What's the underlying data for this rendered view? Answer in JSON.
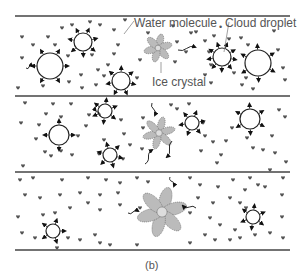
{
  "labels": {
    "water_molecule": "Water molecule",
    "cloud_droplet": "Cloud droplet",
    "ice_crystal": "Ice crystal",
    "caption": "(b)"
  },
  "colors": {
    "line": "#444444",
    "droplet_stroke": "#222222",
    "molecule": "#555555",
    "crystal_fill": "#bbbbbb",
    "crystal_stroke": "#777777",
    "label_text": "#555555"
  },
  "separators": [
    {
      "y": 16,
      "x1": 15,
      "x2": 290
    },
    {
      "y": 96,
      "x1": 15,
      "x2": 290
    },
    {
      "y": 172,
      "x1": 15,
      "x2": 290
    },
    {
      "y": 250,
      "x1": 15,
      "x2": 290
    }
  ],
  "panels": [
    {
      "name": "panel-1",
      "crystal": {
        "cx": 158,
        "cy": 48,
        "r": 13,
        "petal_w": 3.5
      },
      "droplets": [
        {
          "cx": 50,
          "cy": 66,
          "r": 13,
          "arrows": 6
        },
        {
          "cx": 83,
          "cy": 42,
          "r": 9,
          "arrows": 7
        },
        {
          "cx": 121,
          "cy": 81,
          "r": 9,
          "arrows": 7
        },
        {
          "cx": 222,
          "cy": 57,
          "r": 9,
          "arrows": 9
        },
        {
          "cx": 258,
          "cy": 63,
          "r": 13,
          "arrows": 6
        }
      ],
      "molecules": [
        [
          22,
          37
        ],
        [
          33,
          45
        ],
        [
          22,
          58
        ],
        [
          18,
          88
        ],
        [
          43,
          86
        ],
        [
          48,
          37
        ],
        [
          55,
          45
        ],
        [
          62,
          28
        ],
        [
          72,
          25
        ],
        [
          90,
          22
        ],
        [
          100,
          25
        ],
        [
          114,
          30
        ],
        [
          125,
          20
        ],
        [
          118,
          45
        ],
        [
          114,
          54
        ],
        [
          108,
          65
        ],
        [
          98,
          70
        ],
        [
          69,
          82
        ],
        [
          81,
          75
        ],
        [
          82,
          88
        ],
        [
          96,
          85
        ],
        [
          92,
          55
        ],
        [
          68,
          56
        ],
        [
          104,
          76
        ],
        [
          140,
          60
        ],
        [
          137,
          78
        ],
        [
          148,
          33
        ],
        [
          177,
          42
        ],
        [
          186,
          52
        ],
        [
          175,
          62
        ],
        [
          196,
          32
        ],
        [
          205,
          41
        ],
        [
          214,
          36
        ],
        [
          209,
          52
        ],
        [
          211,
          65
        ],
        [
          205,
          75
        ],
        [
          211,
          83
        ],
        [
          229,
          39
        ],
        [
          241,
          38
        ],
        [
          248,
          45
        ],
        [
          234,
          73
        ],
        [
          246,
          78
        ],
        [
          242,
          85
        ],
        [
          253,
          89
        ],
        [
          274,
          31
        ],
        [
          278,
          50
        ],
        [
          283,
          68
        ],
        [
          285,
          80
        ],
        [
          191,
          33
        ],
        [
          173,
          26
        ]
      ]
    },
    {
      "name": "panel-2",
      "crystal": {
        "cx": 159,
        "cy": 133,
        "r": 15,
        "petal_w": 3.5
      },
      "droplets": [
        {
          "cx": 59,
          "cy": 135,
          "r": 10,
          "arrows": 4
        },
        {
          "cx": 105,
          "cy": 111,
          "r": 7,
          "arrows": 6
        },
        {
          "cx": 110,
          "cy": 155,
          "r": 7,
          "arrows": 6
        },
        {
          "cx": 192,
          "cy": 123,
          "r": 7,
          "arrows": 6
        },
        {
          "cx": 250,
          "cy": 119,
          "r": 10,
          "arrows": 6
        }
      ],
      "molecules": [
        [
          25,
          103
        ],
        [
          53,
          104
        ],
        [
          71,
          104
        ],
        [
          46,
          114
        ],
        [
          61,
          117
        ],
        [
          21,
          123
        ],
        [
          39,
          125
        ],
        [
          36,
          139
        ],
        [
          45,
          152
        ],
        [
          23,
          166
        ],
        [
          51,
          156
        ],
        [
          61,
          151
        ],
        [
          72,
          155
        ],
        [
          78,
          136
        ],
        [
          86,
          126
        ],
        [
          89,
          115
        ],
        [
          104,
          140
        ],
        [
          99,
          154
        ],
        [
          121,
          120
        ],
        [
          124,
          134
        ],
        [
          130,
          145
        ],
        [
          123,
          159
        ],
        [
          143,
          118
        ],
        [
          143,
          128
        ],
        [
          142,
          149
        ],
        [
          171,
          105
        ],
        [
          177,
          109
        ],
        [
          189,
          104
        ],
        [
          203,
          123
        ],
        [
          201,
          151
        ],
        [
          205,
          136
        ],
        [
          213,
          142
        ],
        [
          221,
          155
        ],
        [
          217,
          163
        ],
        [
          226,
          141
        ],
        [
          232,
          128
        ],
        [
          247,
          138
        ],
        [
          253,
          148
        ],
        [
          263,
          150
        ],
        [
          272,
          136
        ],
        [
          275,
          153
        ],
        [
          285,
          117
        ],
        [
          279,
          110
        ],
        [
          286,
          162
        ],
        [
          270,
          170
        ]
      ]
    },
    {
      "name": "panel-3",
      "crystal": {
        "cx": 162,
        "cy": 212,
        "r": 23,
        "petal_w": 6
      },
      "droplets": [
        {
          "cx": 53,
          "cy": 231,
          "r": 7,
          "arrows": 5
        },
        {
          "cx": 253,
          "cy": 217,
          "r": 7,
          "arrows": 6
        }
      ],
      "molecules": [
        [
          20,
          180
        ],
        [
          33,
          178
        ],
        [
          62,
          180
        ],
        [
          88,
          178
        ],
        [
          106,
          180
        ],
        [
          120,
          183
        ],
        [
          137,
          178
        ],
        [
          148,
          182
        ],
        [
          190,
          178
        ],
        [
          200,
          185
        ],
        [
          218,
          187
        ],
        [
          233,
          180
        ],
        [
          250,
          178
        ],
        [
          258,
          185
        ],
        [
          283,
          178
        ],
        [
          25,
          195
        ],
        [
          40,
          198
        ],
        [
          60,
          195
        ],
        [
          80,
          193
        ],
        [
          100,
          195
        ],
        [
          118,
          193
        ],
        [
          140,
          208
        ],
        [
          190,
          213
        ],
        [
          198,
          198
        ],
        [
          213,
          203
        ],
        [
          230,
          198
        ],
        [
          240,
          203
        ],
        [
          246,
          208
        ],
        [
          245,
          190
        ],
        [
          265,
          187
        ],
        [
          282,
          195
        ],
        [
          18,
          217
        ],
        [
          43,
          215
        ],
        [
          55,
          213
        ],
        [
          70,
          208
        ],
        [
          88,
          203
        ],
        [
          100,
          210
        ],
        [
          120,
          205
        ],
        [
          210,
          218
        ],
        [
          220,
          225
        ],
        [
          235,
          230
        ],
        [
          240,
          238
        ],
        [
          255,
          235
        ],
        [
          270,
          233
        ],
        [
          282,
          217
        ],
        [
          283,
          238
        ],
        [
          22,
          233
        ],
        [
          35,
          238
        ],
        [
          68,
          238
        ],
        [
          80,
          240
        ],
        [
          95,
          235
        ],
        [
          100,
          243
        ],
        [
          110,
          245
        ],
        [
          137,
          245
        ],
        [
          190,
          243
        ],
        [
          205,
          235
        ],
        [
          215,
          240
        ],
        [
          230,
          240
        ],
        [
          57,
          248
        ]
      ]
    }
  ],
  "wiggle_arrows": [
    {
      "x1": 26,
      "y1": 68,
      "x2": 32,
      "y2": 66
    },
    {
      "x1": 178,
      "y1": 50,
      "x2": 195,
      "y2": 47
    },
    {
      "x1": 152,
      "y1": 103,
      "x2": 155,
      "y2": 115
    },
    {
      "x1": 172,
      "y1": 141,
      "x2": 167,
      "y2": 157
    },
    {
      "x1": 145,
      "y1": 164,
      "x2": 152,
      "y2": 150
    },
    {
      "x1": 170,
      "y1": 177,
      "x2": 174,
      "y2": 186
    },
    {
      "x1": 128,
      "y1": 213,
      "x2": 138,
      "y2": 211
    },
    {
      "x1": 196,
      "y1": 208,
      "x2": 183,
      "y2": 206
    },
    {
      "x1": 100,
      "y1": 116,
      "x2": 95,
      "y2": 108
    }
  ],
  "leaders": [
    {
      "name": "water-molecule-leader",
      "x1": 134,
      "y1": 21,
      "x2": 124,
      "y2": 34
    },
    {
      "name": "cloud-droplet-leader",
      "x1": 229,
      "y1": 22,
      "x2": 224,
      "y2": 52
    },
    {
      "name": "ice-crystal-leader",
      "x1": 161,
      "y1": 62,
      "x2": 161,
      "y2": 73
    }
  ],
  "label_positions": {
    "water_molecule": {
      "x": 134,
      "y": 17
    },
    "cloud_droplet_dot": {
      "x": 219,
      "y": 23
    },
    "cloud_droplet": {
      "x": 225,
      "y": 17
    },
    "ice_crystal": {
      "x": 152,
      "y": 76
    },
    "caption": {
      "x": 145,
      "y": 260
    }
  }
}
